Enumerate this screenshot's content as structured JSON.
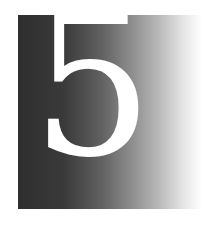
{
  "chapter": {
    "number": "5"
  },
  "colors": {
    "gradient_start": "#2e2e2e",
    "gradient_end": "#ffffff",
    "numeral": "#ffffff",
    "background": "#ffffff"
  }
}
